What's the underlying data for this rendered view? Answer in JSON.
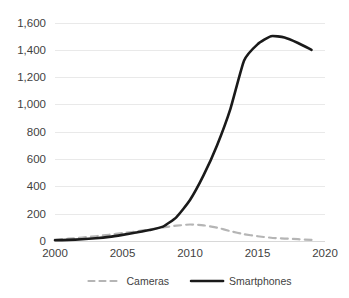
{
  "chart_data": {
    "type": "line",
    "title": "",
    "subtitle": "",
    "xlabel": "",
    "ylabel": "",
    "xlim": [
      2000,
      2020
    ],
    "ylim": [
      0,
      1600
    ],
    "grid": true,
    "legend_position": "bottom",
    "x_ticks": [
      "2000",
      "2005",
      "2010",
      "2015",
      "2020"
    ],
    "x_tick_values": [
      2000,
      2005,
      2010,
      2015,
      2020
    ],
    "y_ticks": [
      "0",
      "200",
      "400",
      "600",
      "800",
      "1,000",
      "1,200",
      "1,400",
      "1,600"
    ],
    "y_tick_values": [
      0,
      200,
      400,
      600,
      800,
      1000,
      1200,
      1400,
      1600
    ],
    "x": [
      2000,
      2001,
      2002,
      2003,
      2004,
      2005,
      2006,
      2007,
      2008,
      2009,
      2010,
      2011,
      2012,
      2013,
      2014,
      2015,
      2016,
      2017,
      2018,
      2019
    ],
    "series": [
      {
        "name": "Cameras",
        "style": "dashed",
        "color": "#b5b5b5",
        "values": [
          10,
          17,
          25,
          35,
          46,
          58,
          70,
          85,
          100,
          112,
          121,
          115,
          98,
          72,
          50,
          35,
          24,
          18,
          13,
          8
        ]
      },
      {
        "name": "Smartphones",
        "style": "solid",
        "color": "#1a1a1a",
        "values": [
          5,
          8,
          13,
          20,
          30,
          45,
          62,
          80,
          105,
          175,
          300,
          480,
          700,
          970,
          1320,
          1440,
          1500,
          1490,
          1450,
          1400
        ]
      }
    ],
    "colors": {
      "cameras": "#b5b5b5",
      "smartphones": "#1a1a1a",
      "gridline": "#e9e9e9",
      "axis_text": "#3f3f3f",
      "background": "#ffffff"
    }
  },
  "legend": {
    "items": [
      {
        "label": "Cameras",
        "marker": "dashed-line-marker"
      },
      {
        "label": "Smartphones",
        "marker": "solid-line-marker"
      }
    ]
  }
}
